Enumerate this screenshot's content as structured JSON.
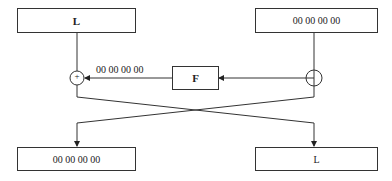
{
  "diagram": {
    "type": "feistel-round",
    "top_left_box": {
      "label": "L"
    },
    "top_right_box": {
      "label": "00 00 00 00"
    },
    "function_box": {
      "label": "F"
    },
    "xor_symbol": "+",
    "f_output_label": "00 00 00 00",
    "bottom_left_box": {
      "label": "00 00 00 00"
    },
    "bottom_right_box": {
      "label": "L"
    }
  }
}
